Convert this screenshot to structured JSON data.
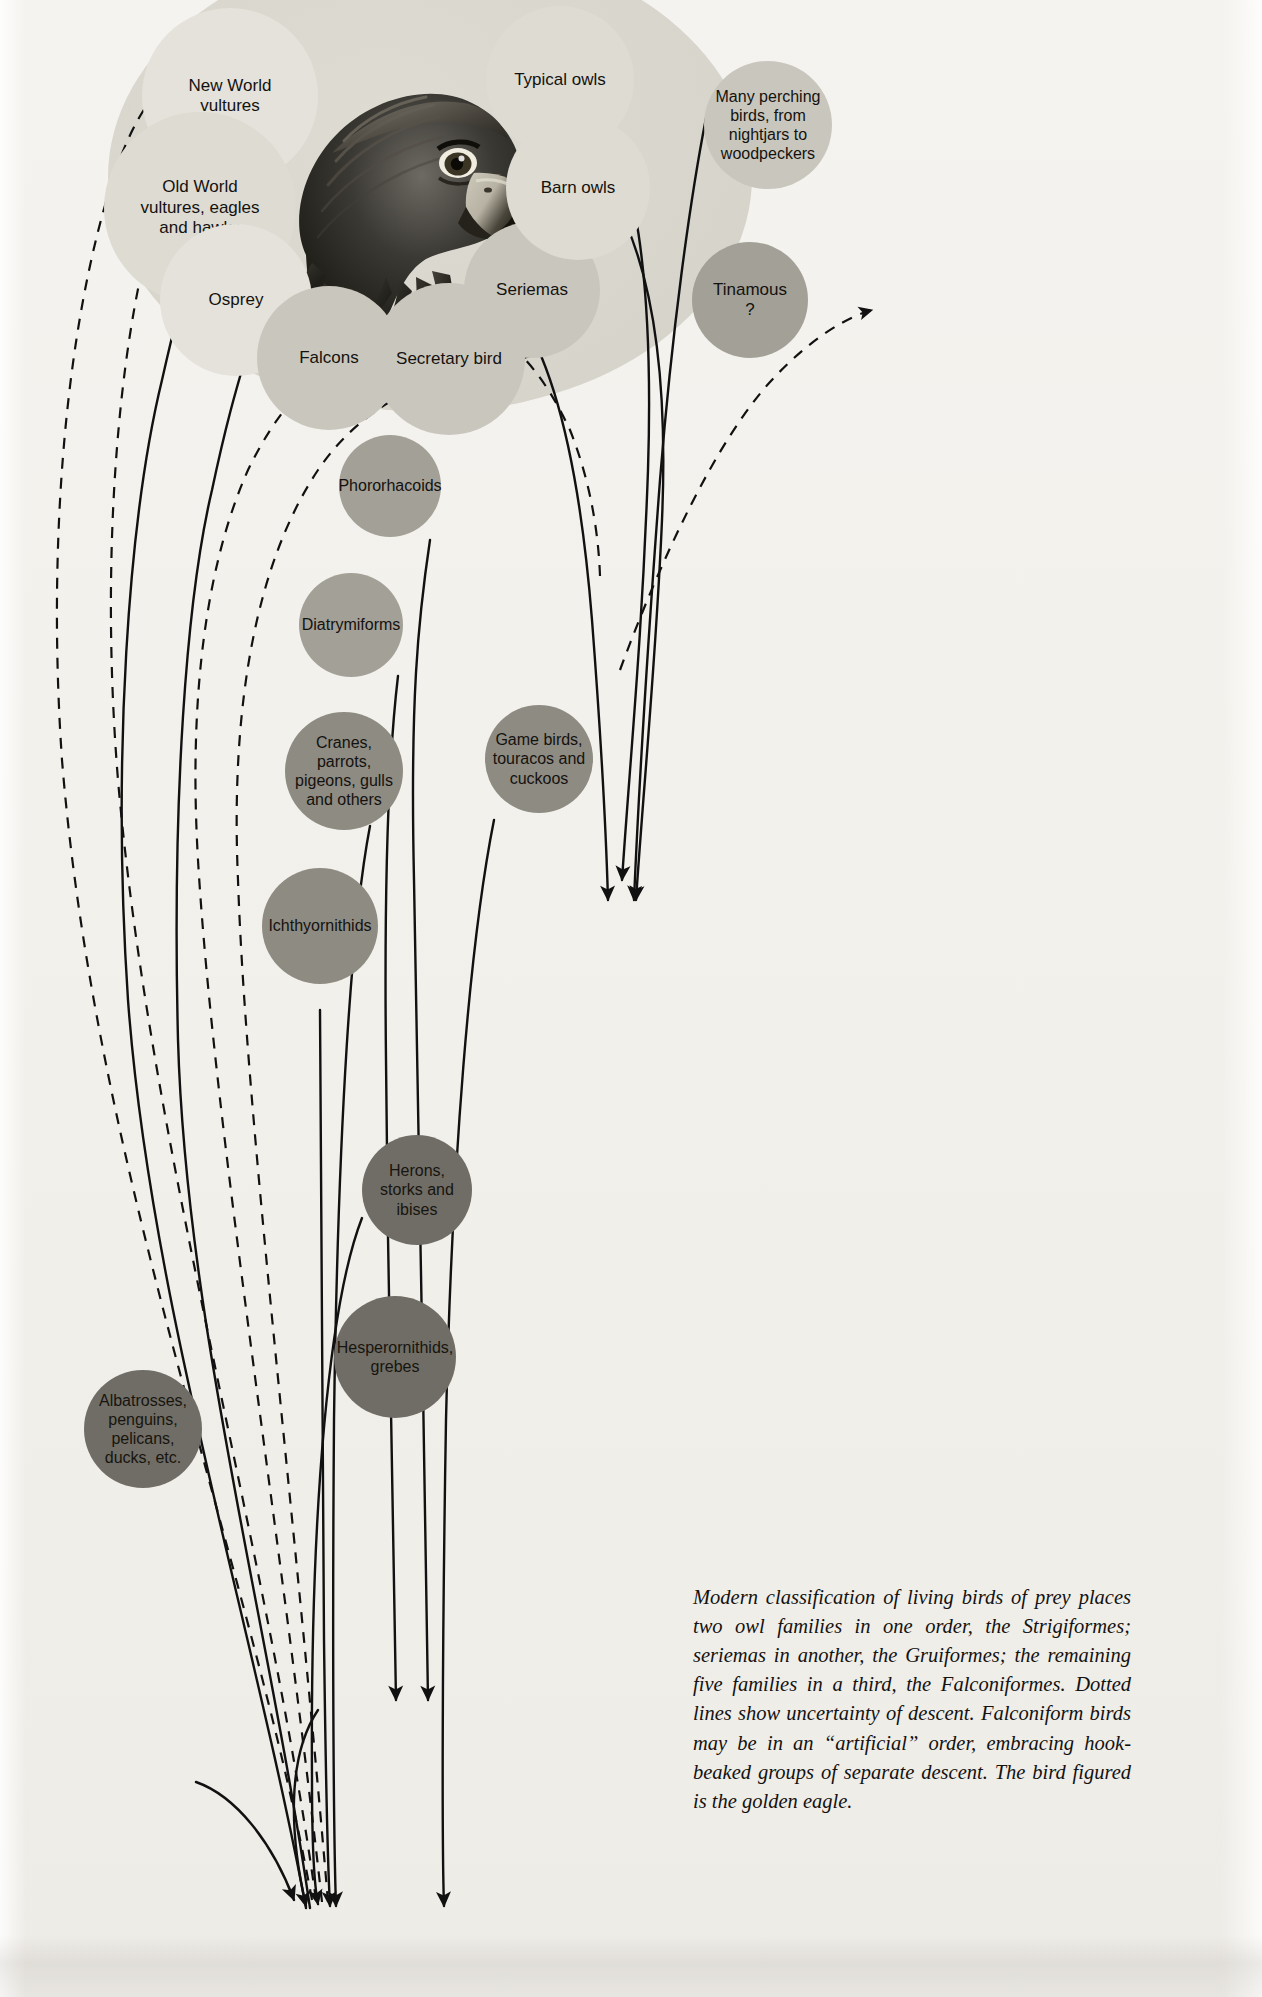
{
  "figure": {
    "kind": "phylogenetic-diagram",
    "bird_illustration": "golden-eagle-head"
  },
  "group_oval": {
    "label": "birds-of-prey-grouping-oval"
  },
  "nodes": [
    {
      "id": "new-world-vultures",
      "label": "New World\nvultures",
      "tone": "t-lightest",
      "x": 142,
      "y": 8,
      "d": 176,
      "fs": 17
    },
    {
      "id": "old-world-vultures",
      "label": "Old World\nvultures, eagles\nand hawks",
      "tone": "t-light",
      "x": 104,
      "y": 112,
      "d": 192,
      "fs": 17
    },
    {
      "id": "osprey",
      "label": "Osprey",
      "tone": "t-lightest",
      "x": 160,
      "y": 224,
      "d": 152,
      "fs": 17
    },
    {
      "id": "falcons",
      "label": "Falcons",
      "tone": "t-mid",
      "x": 257,
      "y": 286,
      "d": 144,
      "fs": 17
    },
    {
      "id": "secretary-bird",
      "label": "Secretary bird",
      "tone": "t-mid",
      "x": 373,
      "y": 283,
      "d": 152,
      "fs": 17
    },
    {
      "id": "seriemas",
      "label": "Seriemas",
      "tone": "t-mid",
      "x": 464,
      "y": 222,
      "d": 136,
      "fs": 17
    },
    {
      "id": "typical-owls",
      "label": "Typical owls",
      "tone": "t-light",
      "x": 486,
      "y": 6,
      "d": 148,
      "fs": 17
    },
    {
      "id": "barn-owls",
      "label": "Barn owls",
      "tone": "t-light",
      "x": 506,
      "y": 116,
      "d": 144,
      "fs": 17
    },
    {
      "id": "perching-birds",
      "label": "Many perching\nbirds, from\nnightjars to\nwoodpeckers",
      "tone": "t-mid",
      "x": 704,
      "y": 61,
      "d": 128,
      "fs": 16
    },
    {
      "id": "tinamous",
      "label": "Tinamous\n?",
      "tone": "t-dark",
      "x": 692,
      "y": 242,
      "d": 116,
      "fs": 17
    },
    {
      "id": "phororhacoids",
      "label": "Phororhacoids",
      "tone": "t-dark",
      "x": 339,
      "y": 435,
      "d": 102,
      "fs": 16
    },
    {
      "id": "diatrymiforms",
      "label": "Diatrymiforms",
      "tone": "t-dark",
      "x": 299,
      "y": 573,
      "d": 104,
      "fs": 16
    },
    {
      "id": "cranes-parrots",
      "label": "Cranes,\nparrots,\npigeons, gulls\nand others",
      "tone": "t-darker",
      "x": 285,
      "y": 712,
      "d": 118,
      "fs": 16
    },
    {
      "id": "game-birds",
      "label": "Game birds,\ntouracos and\ncuckoos",
      "tone": "t-darker",
      "x": 485,
      "y": 705,
      "d": 108,
      "fs": 16
    },
    {
      "id": "ichthyornithids",
      "label": "Ichthyornithids",
      "tone": "t-darker",
      "x": 262,
      "y": 868,
      "d": 116,
      "fs": 16
    },
    {
      "id": "herons-storks",
      "label": "Herons,\nstorks and\nibises",
      "tone": "t-darkest",
      "x": 362,
      "y": 1135,
      "d": 110,
      "fs": 16
    },
    {
      "id": "hesperornithids",
      "label": "Hesperornithids,\ngrebes",
      "tone": "t-darkest",
      "x": 334,
      "y": 1296,
      "d": 122,
      "fs": 16
    },
    {
      "id": "albatrosses",
      "label": "Albatrosses,\npenguins,\npelicans,\nducks, etc.",
      "tone": "t-darkest",
      "x": 84,
      "y": 1370,
      "d": 118,
      "fs": 16
    }
  ],
  "legend": {
    "solid_lines": "line of descent",
    "dotted_lines": "uncertainty of descent"
  },
  "caption": {
    "text": "Modern classification of living birds of prey places two owl families in one order, the Strigiformes; seriemas in another, the Gruiformes; the remaining five families in a third, the Falconiformes. Dotted lines show uncertainty of descent. Falconiform birds may be in an “artificial” order, embracing hook-beaked groups of separate descent. The bird figured is the golden eagle."
  },
  "colors": {
    "page": "#f3f1ec",
    "oval": "#d9d6ce",
    "ink": "#14120f",
    "lightest": "#e4e2da",
    "light": "#dddbd2",
    "mid": "#c9c7bd",
    "dark": "#a3a097",
    "darker": "#8e8b82",
    "darkest": "#706d66"
  }
}
